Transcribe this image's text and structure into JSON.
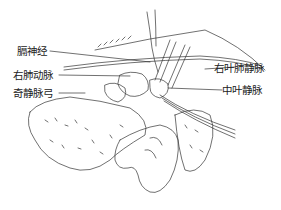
{
  "figure": {
    "labels": {
      "phrenic_nerve": "膈神经",
      "right_pulmonary_artery": "右肺动脉",
      "azygos_arch": "奇静脉弓",
      "right_upper_pulmonary_vein": "右叶肺静脉",
      "middle_lobe_vein": "中叶静脉"
    },
    "colors": {
      "line": "#333333",
      "background": "#ffffff",
      "caption": "#d8d8d8"
    }
  }
}
